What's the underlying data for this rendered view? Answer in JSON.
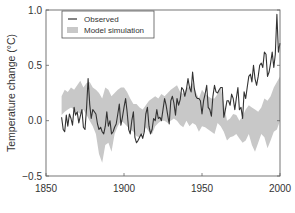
{
  "chart_data": {
    "type": "line",
    "title": "",
    "xlabel": "",
    "ylabel": "Temperature change (°C)",
    "xlim": [
      1850,
      2000
    ],
    "ylim": [
      -0.5,
      1.0
    ],
    "xticks": [
      1850,
      1900,
      1950,
      2000
    ],
    "xtick_labels": [
      "1850",
      "1900",
      "1950",
      "2000"
    ],
    "yticks": [
      -0.5,
      0.0,
      0.5,
      1.0
    ],
    "ytick_labels": [
      "−0.5",
      "0.0",
      "0.5",
      "1.0"
    ],
    "grid": false,
    "legend": {
      "position": "upper left",
      "entries": [
        {
          "label": "Observed",
          "style": "line",
          "color": "#333333"
        },
        {
          "label": "Model simulation",
          "style": "band",
          "color": "#c8c8c8"
        }
      ]
    },
    "series": [
      {
        "name": "Observed",
        "type": "line",
        "color": "#333333",
        "x": [
          1860,
          1861,
          1862,
          1863,
          1864,
          1865,
          1866,
          1867,
          1868,
          1869,
          1870,
          1871,
          1872,
          1873,
          1874,
          1875,
          1876,
          1877,
          1878,
          1879,
          1880,
          1881,
          1882,
          1883,
          1884,
          1885,
          1886,
          1887,
          1888,
          1889,
          1890,
          1891,
          1892,
          1893,
          1894,
          1895,
          1896,
          1897,
          1898,
          1899,
          1900,
          1901,
          1902,
          1903,
          1904,
          1905,
          1906,
          1907,
          1908,
          1909,
          1910,
          1911,
          1912,
          1913,
          1914,
          1915,
          1916,
          1917,
          1918,
          1919,
          1920,
          1921,
          1922,
          1923,
          1924,
          1925,
          1926,
          1927,
          1928,
          1929,
          1930,
          1931,
          1932,
          1933,
          1934,
          1935,
          1936,
          1937,
          1938,
          1939,
          1940,
          1941,
          1942,
          1943,
          1944,
          1945,
          1946,
          1947,
          1948,
          1949,
          1950,
          1951,
          1952,
          1953,
          1954,
          1955,
          1956,
          1957,
          1958,
          1959,
          1960,
          1961,
          1962,
          1963,
          1964,
          1965,
          1966,
          1967,
          1968,
          1969,
          1970,
          1971,
          1972,
          1973,
          1974,
          1975,
          1976,
          1977,
          1978,
          1979,
          1980,
          1981,
          1982,
          1983,
          1984,
          1985,
          1986,
          1987,
          1988,
          1989,
          1990,
          1991,
          1992,
          1993,
          1994,
          1995,
          1996,
          1997,
          1998,
          1999,
          2000
        ],
        "values": [
          0.03,
          -0.08,
          -0.1,
          0.05,
          -0.05,
          0.06,
          0.02,
          -0.04,
          0.12,
          0.05,
          0.08,
          -0.02,
          0.04,
          0.1,
          -0.06,
          -0.08,
          0.12,
          0.38,
          0.15,
          0.02,
          0.1,
          0.08,
          0.06,
          -0.03,
          -0.08,
          -0.06,
          -0.1,
          -0.12,
          -0.05,
          0.08,
          -0.05,
          0.0,
          -0.12,
          -0.1,
          -0.06,
          -0.03,
          0.06,
          0.15,
          -0.04,
          0.03,
          0.12,
          0.2,
          0.08,
          -0.08,
          -0.12,
          0.0,
          0.08,
          -0.15,
          -0.2,
          -0.18,
          -0.15,
          -0.12,
          -0.16,
          -0.1,
          0.06,
          0.12,
          -0.05,
          -0.12,
          -0.08,
          0.02,
          0.0,
          0.1,
          0.02,
          0.03,
          0.0,
          0.1,
          0.2,
          0.14,
          0.05,
          -0.03,
          0.18,
          0.22,
          0.16,
          0.05,
          0.2,
          0.14,
          0.19,
          0.3,
          0.28,
          0.22,
          0.28,
          0.38,
          0.3,
          0.26,
          0.44,
          0.3,
          0.22,
          0.2,
          0.2,
          0.18,
          0.06,
          0.18,
          0.24,
          0.32,
          0.12,
          0.1,
          0.04,
          0.22,
          0.32,
          0.26,
          0.25,
          0.28,
          0.3,
          0.3,
          0.03,
          0.1,
          0.18,
          0.18,
          0.14,
          0.24,
          0.2,
          0.1,
          0.2,
          0.3,
          0.1,
          0.12,
          0.02,
          0.26,
          0.2,
          0.3,
          0.4,
          0.42,
          0.35,
          0.5,
          0.38,
          0.32,
          0.4,
          0.5,
          0.52,
          0.48,
          0.62,
          0.6,
          0.4,
          0.44,
          0.52,
          0.62,
          0.48,
          0.6,
          0.96,
          0.62,
          0.7
        ]
      },
      {
        "name": "Model simulation",
        "type": "area",
        "color": "#c8c8c8",
        "x": [
          1860,
          1862,
          1864,
          1866,
          1868,
          1870,
          1872,
          1874,
          1876,
          1878,
          1880,
          1882,
          1884,
          1886,
          1888,
          1890,
          1892,
          1894,
          1896,
          1898,
          1900,
          1902,
          1904,
          1906,
          1908,
          1910,
          1912,
          1914,
          1916,
          1918,
          1920,
          1922,
          1924,
          1926,
          1928,
          1930,
          1932,
          1934,
          1936,
          1938,
          1940,
          1942,
          1944,
          1946,
          1948,
          1950,
          1952,
          1954,
          1956,
          1958,
          1960,
          1962,
          1964,
          1966,
          1968,
          1970,
          1972,
          1974,
          1976,
          1978,
          1980,
          1982,
          1984,
          1986,
          1988,
          1990,
          1992,
          1994,
          1996,
          1998,
          2000
        ],
        "upper": [
          0.22,
          0.28,
          0.26,
          0.3,
          0.28,
          0.32,
          0.36,
          0.3,
          0.34,
          0.35,
          0.3,
          0.28,
          0.25,
          0.2,
          0.3,
          0.28,
          0.22,
          0.25,
          0.28,
          0.3,
          0.3,
          0.26,
          0.2,
          0.15,
          0.15,
          0.12,
          0.1,
          0.14,
          0.18,
          0.2,
          0.22,
          0.2,
          0.24,
          0.22,
          0.25,
          0.28,
          0.3,
          0.32,
          0.26,
          0.24,
          0.3,
          0.3,
          0.34,
          0.26,
          0.2,
          0.28,
          0.24,
          0.22,
          0.2,
          0.2,
          0.24,
          0.3,
          0.16,
          0.0,
          0.02,
          0.06,
          0.05,
          0.0,
          0.04,
          0.1,
          0.14,
          0.12,
          0.1,
          0.08,
          0.12,
          0.2,
          0.18,
          0.22,
          0.3,
          0.35,
          0.4
        ],
        "lower": [
          0.05,
          0.08,
          0.1,
          0.12,
          0.1,
          0.08,
          0.06,
          0.1,
          0.05,
          0.0,
          -0.05,
          -0.12,
          -0.3,
          -0.38,
          -0.22,
          -0.2,
          -0.28,
          -0.12,
          -0.05,
          0.0,
          -0.02,
          -0.05,
          -0.08,
          -0.1,
          -0.14,
          -0.15,
          -0.12,
          -0.06,
          -0.1,
          -0.12,
          -0.05,
          -0.02,
          0.0,
          0.0,
          -0.02,
          0.0,
          0.02,
          0.0,
          -0.04,
          -0.06,
          0.0,
          -0.05,
          -0.02,
          -0.04,
          -0.1,
          -0.05,
          -0.06,
          -0.08,
          -0.1,
          -0.12,
          -0.02,
          -0.05,
          -0.1,
          -0.18,
          -0.15,
          -0.14,
          -0.12,
          -0.16,
          -0.2,
          -0.18,
          -0.12,
          -0.22,
          -0.28,
          -0.2,
          -0.12,
          -0.15,
          -0.25,
          -0.18,
          -0.1,
          -0.08,
          0.0
        ]
      }
    ]
  },
  "axes": {
    "ylabel": "Temperature change (°C)",
    "xtick_labels": [
      "1850",
      "1900",
      "1950",
      "2000"
    ],
    "ytick_labels": [
      "−0.5",
      "0.0",
      "0.5",
      "1.0"
    ]
  },
  "legend": {
    "observed_label": "Observed",
    "model_label": "Model simulation"
  }
}
